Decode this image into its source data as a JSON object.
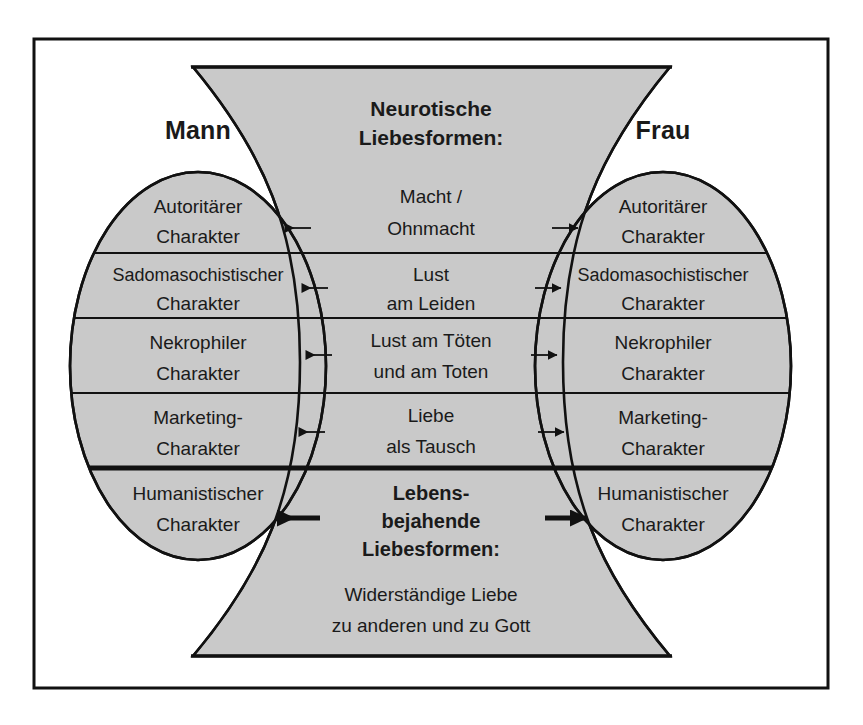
{
  "diagram": {
    "title_left": "Mann",
    "title_right": "Frau",
    "center_heading_line1": "Neurotische",
    "center_heading_line2": "Liebesformen:",
    "center_bottom_heading_line1": "Lebens-",
    "center_bottom_heading_line2": "bejahende",
    "center_bottom_heading_line3": "Liebesformen:",
    "center_rows": [
      {
        "line1": "Macht /",
        "line2": "Ohnmacht"
      },
      {
        "line1": "Lust",
        "line2": "am Leiden"
      },
      {
        "line1": "Lust am Töten",
        "line2": "und am Toten"
      },
      {
        "line1": "Liebe",
        "line2": "als Tausch"
      }
    ],
    "center_bottom_rows": [
      {
        "line1": "Widerständige Liebe",
        "line2": "zu anderen und zu Gott"
      }
    ],
    "left_rows": [
      {
        "line1": "Autoritärer",
        "line2": "Charakter"
      },
      {
        "line1": "Sadomasochistischer",
        "line2": "Charakter"
      },
      {
        "line1": "Nekrophiler",
        "line2": "Charakter"
      },
      {
        "line1": "Marketing-",
        "line2": "Charakter"
      },
      {
        "line1": "Humanistischer",
        "line2": "Charakter"
      }
    ],
    "right_rows": [
      {
        "line1": "Autoritärer",
        "line2": "Charakter"
      },
      {
        "line1": "Sadomasochistischer",
        "line2": "Charakter"
      },
      {
        "line1": "Nekrophiler",
        "line2": "Charakter"
      },
      {
        "line1": "Marketing-",
        "line2": "Charakter"
      },
      {
        "line1": "Humanistischer",
        "line2": "Charakter"
      }
    ],
    "arrows": [
      {
        "name": "arrow-macht-ohnmacht-left",
        "weight": "thin"
      },
      {
        "name": "arrow-macht-ohnmacht-right",
        "weight": "thin"
      },
      {
        "name": "arrow-lust-am-leiden-left",
        "weight": "thin"
      },
      {
        "name": "arrow-lust-am-leiden-right",
        "weight": "thin"
      },
      {
        "name": "arrow-lust-am-toeten-left",
        "weight": "thin"
      },
      {
        "name": "arrow-lust-am-toeten-right",
        "weight": "thin"
      },
      {
        "name": "arrow-liebe-als-tausch-left",
        "weight": "thin"
      },
      {
        "name": "arrow-liebe-als-tausch-right",
        "weight": "thin"
      },
      {
        "name": "arrow-lebensbejahende-left",
        "weight": "thick"
      },
      {
        "name": "arrow-lebensbejahende-right",
        "weight": "thick"
      }
    ],
    "colors": {
      "fill_gray": "#c9c9c9",
      "stroke": "#111111",
      "background": "#ffffff",
      "text": "#1a1a1a"
    }
  }
}
